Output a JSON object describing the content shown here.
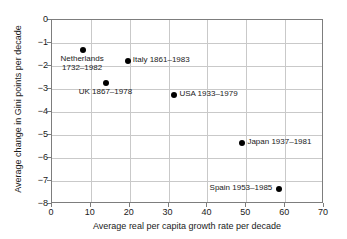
{
  "chart_data": {
    "type": "scatter",
    "title": "",
    "xlabel": "Average real per capita growth rate per decade",
    "ylabel": "Average change in Gini points per decade",
    "xlim": [
      0,
      70
    ],
    "ylim": [
      -8,
      0
    ],
    "xticks": [
      "0",
      "10",
      "20",
      "30",
      "40",
      "50",
      "60",
      "70"
    ],
    "xtick_values": [
      0,
      10,
      20,
      30,
      40,
      50,
      60,
      70
    ],
    "yticks": [
      "0",
      "−1",
      "−2",
      "−3",
      "−4",
      "−5",
      "−6",
      "−7",
      "−8"
    ],
    "ytick_values": [
      0,
      -1,
      -2,
      -3,
      -4,
      -5,
      -6,
      -7,
      -8
    ],
    "grid": true,
    "legend": "none",
    "marker_color": "#000000",
    "grid_color": "#c9c9c9",
    "axis_color": "#7d7d7d",
    "points": [
      {
        "label": "Netherlands\n1732–1982",
        "label_line1": "Netherlands",
        "label_line2": "1732–1982",
        "x": 8,
        "y": -1.3,
        "label_position": "below-center"
      },
      {
        "label": "Italy 1861–1983",
        "label_line1": "Italy 1861–1983",
        "x": 19.5,
        "y": -1.8,
        "label_position": "right"
      },
      {
        "label": "UK 1867–1978",
        "label_line1": "UK 1867–1978",
        "x": 14,
        "y": -2.75,
        "label_position": "below-center"
      },
      {
        "label": "USA 1933–1979",
        "label_line1": "USA 1933–1979",
        "x": 31.5,
        "y": -3.25,
        "label_position": "right"
      },
      {
        "label": "Japan 1937–1981",
        "label_line1": "Japan 1937–1981",
        "x": 49,
        "y": -5.35,
        "label_position": "right"
      },
      {
        "label": "Spain 1953–1985",
        "label_line1": "Spain 1953–1985",
        "x": 58.5,
        "y": -7.35,
        "label_position": "left"
      }
    ]
  }
}
